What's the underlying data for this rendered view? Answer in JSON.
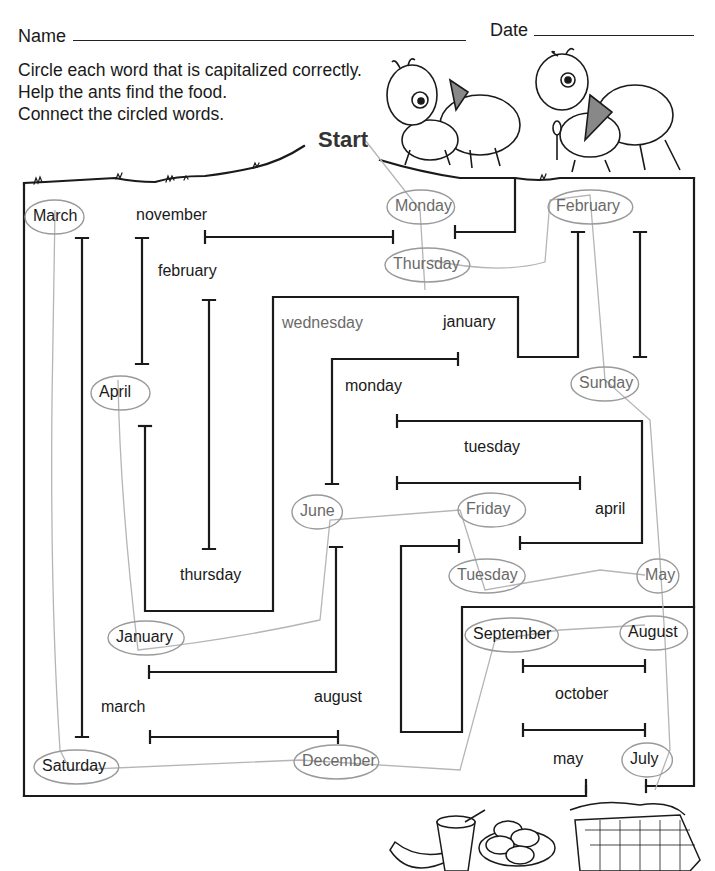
{
  "header": {
    "name_label": "Name",
    "date_label": "Date"
  },
  "instructions": [
    "Circle each word that is capitalized correctly.",
    "Help the ants find the food.",
    "Connect the circled words."
  ],
  "start_label": "Start",
  "words": [
    {
      "text": "March",
      "x": 33,
      "y": 207,
      "circled": true,
      "faded": false
    },
    {
      "text": "november",
      "x": 136,
      "y": 206,
      "circled": false,
      "faded": false
    },
    {
      "text": "Monday",
      "x": 395,
      "y": 197,
      "circled": true,
      "faded": true
    },
    {
      "text": "February",
      "x": 556,
      "y": 197,
      "circled": true,
      "faded": true
    },
    {
      "text": "Thursday",
      "x": 393,
      "y": 255,
      "circled": true,
      "faded": true
    },
    {
      "text": "february",
      "x": 158,
      "y": 262,
      "circled": false,
      "faded": false
    },
    {
      "text": "wednesday",
      "x": 282,
      "y": 314,
      "circled": false,
      "faded": true
    },
    {
      "text": "january",
      "x": 443,
      "y": 313,
      "circled": false,
      "faded": false
    },
    {
      "text": "monday",
      "x": 345,
      "y": 377,
      "circled": false,
      "faded": false
    },
    {
      "text": "April",
      "x": 99,
      "y": 383,
      "circled": true,
      "faded": false
    },
    {
      "text": "Sunday",
      "x": 579,
      "y": 374,
      "circled": true,
      "faded": true
    },
    {
      "text": "tuesday",
      "x": 464,
      "y": 438,
      "circled": false,
      "faded": false
    },
    {
      "text": "June",
      "x": 300,
      "y": 502,
      "circled": true,
      "faded": true
    },
    {
      "text": "Friday",
      "x": 466,
      "y": 500,
      "circled": true,
      "faded": true
    },
    {
      "text": "april",
      "x": 595,
      "y": 500,
      "circled": false,
      "faded": false
    },
    {
      "text": "thursday",
      "x": 180,
      "y": 566,
      "circled": false,
      "faded": false
    },
    {
      "text": "Tuesday",
      "x": 457,
      "y": 566,
      "circled": true,
      "faded": true
    },
    {
      "text": "May",
      "x": 645,
      "y": 566,
      "circled": true,
      "faded": true
    },
    {
      "text": "January",
      "x": 116,
      "y": 628,
      "circled": true,
      "faded": false
    },
    {
      "text": "September",
      "x": 473,
      "y": 625,
      "circled": true,
      "faded": false
    },
    {
      "text": "August",
      "x": 628,
      "y": 623,
      "circled": true,
      "faded": false
    },
    {
      "text": "october",
      "x": 555,
      "y": 685,
      "circled": false,
      "faded": false
    },
    {
      "text": "march",
      "x": 101,
      "y": 698,
      "circled": false,
      "faded": false
    },
    {
      "text": "august",
      "x": 314,
      "y": 688,
      "circled": false,
      "faded": false
    },
    {
      "text": "Saturday",
      "x": 42,
      "y": 757,
      "circled": true,
      "faded": false
    },
    {
      "text": "December",
      "x": 302,
      "y": 752,
      "circled": true,
      "faded": true
    },
    {
      "text": "may",
      "x": 553,
      "y": 750,
      "circled": false,
      "faded": false
    },
    {
      "text": "July",
      "x": 630,
      "y": 750,
      "circled": true,
      "faded": false
    }
  ],
  "illustrations": {
    "ants": [
      "ant-with-fork",
      "ant-with-spoon"
    ],
    "food": [
      "banana",
      "glass-with-straw",
      "plate-of-cookies",
      "picnic-basket"
    ]
  }
}
